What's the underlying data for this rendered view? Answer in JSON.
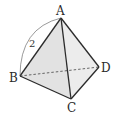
{
  "figure": {
    "type": "tetrahedron",
    "vertices": {
      "A": "A",
      "B": "B",
      "C": "C",
      "D": "D"
    },
    "edge_length_label": "2",
    "labeled_edge": "AB",
    "hidden_edge": "BD",
    "colors": {
      "edge": "#2b2b2b",
      "face_front_left": "#e2e2e2",
      "face_front_right": "#ececec",
      "face_front_bottom": "#d6d6d6",
      "arc": "#555555",
      "dashed": "#444444"
    }
  }
}
